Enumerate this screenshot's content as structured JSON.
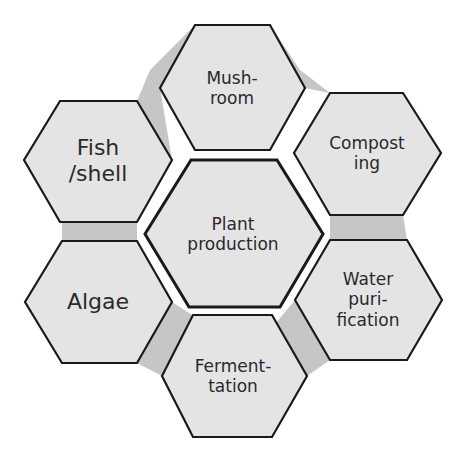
{
  "diagram": {
    "type": "hexagon-cycle",
    "colors": {
      "hex_fill": "#e4e4e4",
      "hex_stroke": "#1a1a1a",
      "connector": "#c6c6c6",
      "text": "#2a2a2a",
      "background": "#ffffff"
    },
    "center": {
      "lines": [
        "Plant",
        "production"
      ]
    },
    "nodes": [
      {
        "id": "mushroom",
        "lines": [
          "Mush-",
          "room"
        ]
      },
      {
        "id": "composting",
        "lines": [
          "Compost",
          "ing"
        ]
      },
      {
        "id": "water-purification",
        "lines": [
          "Water",
          "puri-",
          "fication"
        ]
      },
      {
        "id": "fermentation",
        "lines": [
          "Ferment-",
          "tation"
        ]
      },
      {
        "id": "algae",
        "lines": [
          "Algae"
        ]
      },
      {
        "id": "fish-shell",
        "lines": [
          "Fish",
          "/shell"
        ]
      }
    ]
  }
}
